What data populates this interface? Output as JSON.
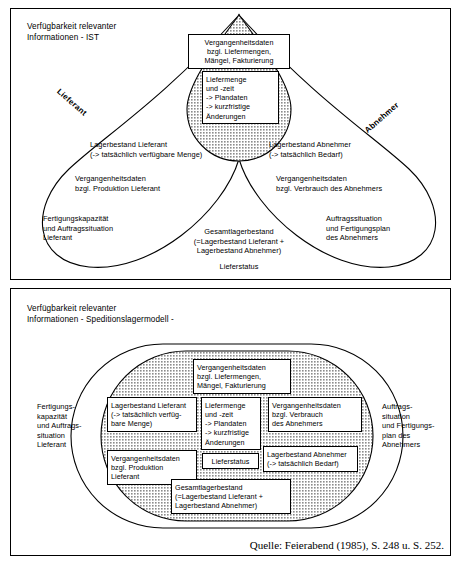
{
  "figure": {
    "source_note": "Quelle: Feierabend (1985), S. 248 u. S. 252.",
    "hatch_color": "#8c8c8c",
    "line_color": "#000000",
    "background": "#ffffff"
  },
  "panel_top": {
    "title": "Verfügbarkeit relevanter\nInformationen - IST",
    "axis_labels": {
      "left": "Lieferant",
      "right": "Abnehmer"
    },
    "overlap_boxes": [
      {
        "id": "vergangenheitsdaten-liefermengen",
        "text": "Vergangenheitsdaten\nbzgl. Liefermengen,\nMängel, Fakturierung"
      },
      {
        "id": "liefermenge-und-zeit",
        "text": "Liefermenge\nund -zeit\n-> Plandaten\n-> kurzfristige\n    Änderungen"
      }
    ],
    "left_labels": [
      {
        "id": "lagerbestand-lieferant",
        "text": "Lagerbestand Lieferant\n(-> tatsächlich verfügbare Menge)"
      },
      {
        "id": "vergangenheitsdaten-produktion",
        "text": "Vergangenheitsdaten\nbzgl. Produktion Lieferant"
      },
      {
        "id": "fertigungskapazitaet-lieferant",
        "text": "Fertigungskapazität\nund Auftragssituation\nLieferant"
      }
    ],
    "right_labels": [
      {
        "id": "lagerbestand-abnehmer",
        "text": "Lagerbestand Abnehmer\n(-> tatsächlich Bedarf)"
      },
      {
        "id": "vergangenheitsdaten-verbrauch",
        "text": "Vergangenheitsdaten\nbzgl. Verbrauch des Abnehmers"
      },
      {
        "id": "auftragssituation-abnehmer",
        "text": "Auftragssituation\nund Fertigungsplan\ndes Abnehmers"
      }
    ],
    "bottom_labels": [
      {
        "id": "gesamtlagerbestand",
        "text": "Gesamtlagerbestand\n(=Lagerbestand Lieferant +\nLagerbestand Abnehmer)"
      },
      {
        "id": "lieferstatus",
        "text": "Lieferstatus"
      }
    ]
  },
  "panel_bottom": {
    "title": "Verfügbarkeit relevanter\nInformationen - Speditionslagermodell -",
    "outside_left": {
      "id": "fertigungskapazitaet-lieferant",
      "text": "Fertigungs-\nkapazität\nund Auftrags-\nsituation\nLieferant"
    },
    "outside_right": {
      "id": "auftragssituation-abnehmer",
      "text": "Auftrags-\nsituation\nund Fertigungs-\nplan des\nAbnehmers"
    },
    "inner_boxes": [
      {
        "id": "vergangenheitsdaten-liefermengen",
        "text": "Vergangenheitsdaten\nbzgl. Liefermengen,\nMängel, Fakturierung"
      },
      {
        "id": "lagerbestand-lieferant",
        "text": "Lagerbestand Lieferant\n(-> tatsächlich verfüg-\nbare Menge)"
      },
      {
        "id": "liefermenge-und-zeit",
        "text": "Liefermenge\nund -zeit\n-> Plandaten\n-> kurzfristige\n   Änderungen"
      },
      {
        "id": "vergangenheitsdaten-verbrauch",
        "text": "Vergangenheitsdaten\nbzgl. Verbrauch\ndes Abnehmers"
      },
      {
        "id": "vergangenheitsdaten-produktion",
        "text": "Vergangenheitsdaten\nbzgl. Produktion Lieferant"
      },
      {
        "id": "lieferstatus",
        "text": "Lieferstatus"
      },
      {
        "id": "lagerbestand-abnehmer",
        "text": "Lagerbestand Abnehmer\n(-> tatsächlich Bedarf)"
      },
      {
        "id": "gesamtlagerbestand",
        "text": "Gesamtlagerbestand\n(=Lagerbestand Lieferant +\nLagerbestand Abnehmer)"
      }
    ]
  }
}
